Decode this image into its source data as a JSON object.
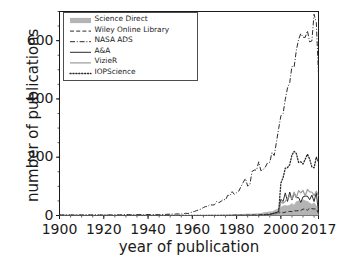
{
  "chart_data": {
    "type": "line",
    "title": "",
    "xlabel": "year of publication",
    "ylabel": "number of publications",
    "xlim": [
      1900,
      2017
    ],
    "ylim": [
      0,
      700
    ],
    "xticks": [
      1900,
      1920,
      1940,
      1960,
      1980,
      2000,
      2017
    ],
    "yticks": [
      0,
      200,
      400,
      600
    ],
    "grid": false,
    "legend_position": "upper-left",
    "x": [
      1900,
      1905,
      1910,
      1915,
      1920,
      1925,
      1930,
      1935,
      1940,
      1945,
      1950,
      1953,
      1956,
      1958,
      1960,
      1962,
      1964,
      1966,
      1968,
      1970,
      1972,
      1974,
      1976,
      1978,
      1980,
      1982,
      1984,
      1986,
      1988,
      1990,
      1991,
      1992,
      1993,
      1994,
      1995,
      1996,
      1997,
      1998,
      1999,
      2000,
      2001,
      2002,
      2003,
      2004,
      2005,
      2006,
      2007,
      2008,
      2009,
      2010,
      2011,
      2012,
      2013,
      2014,
      2015,
      2016,
      2017
    ],
    "series": [
      {
        "name": "Science Direct",
        "style": "band",
        "color": "#b4b4b4",
        "linewidth": 5,
        "values": [
          0,
          0,
          0,
          0,
          0,
          0,
          0,
          0,
          0,
          0,
          0,
          0,
          0,
          0,
          0,
          0,
          0,
          0,
          1,
          1,
          1,
          2,
          2,
          2,
          3,
          3,
          4,
          4,
          5,
          6,
          7,
          8,
          9,
          10,
          12,
          14,
          16,
          18,
          20,
          24,
          28,
          32,
          34,
          36,
          38,
          40,
          42,
          44,
          46,
          48,
          46,
          44,
          42,
          40,
          38,
          34,
          4
        ]
      },
      {
        "name": "Wiley Online Library",
        "style": "dashed",
        "color": "#2b2b2b",
        "linewidth": 1,
        "values": [
          0,
          0,
          0,
          0,
          0,
          0,
          0,
          0,
          0,
          0,
          0,
          0,
          0,
          0,
          0,
          0,
          0,
          0,
          0,
          0,
          0,
          0,
          0,
          1,
          1,
          1,
          1,
          2,
          2,
          2,
          3,
          3,
          4,
          4,
          5,
          5,
          6,
          7,
          8,
          9,
          10,
          11,
          12,
          13,
          14,
          15,
          16,
          17,
          18,
          19,
          20,
          21,
          22,
          23,
          24,
          24,
          6
        ]
      },
      {
        "name": "NASA ADS",
        "style": "dashdot",
        "color": "#2b2b2b",
        "linewidth": 1,
        "values": [
          2,
          2,
          2,
          2,
          2,
          2,
          3,
          3,
          3,
          3,
          4,
          5,
          6,
          8,
          12,
          18,
          22,
          28,
          34,
          42,
          48,
          56,
          64,
          72,
          84,
          96,
          112,
          126,
          142,
          160,
          168,
          150,
          176,
          182,
          190,
          210,
          230,
          250,
          280,
          320,
          360,
          400,
          420,
          470,
          500,
          530,
          560,
          580,
          600,
          610,
          600,
          640,
          620,
          600,
          690,
          640,
          500
        ]
      },
      {
        "name": "A&A",
        "style": "solid",
        "color": "#2b2b2b",
        "linewidth": 1,
        "values": [
          0,
          0,
          0,
          0,
          0,
          0,
          0,
          0,
          0,
          0,
          0,
          0,
          0,
          0,
          0,
          0,
          0,
          0,
          0,
          0,
          0,
          0,
          0,
          0,
          0,
          0,
          0,
          0,
          0,
          0,
          1,
          1,
          2,
          3,
          4,
          6,
          8,
          10,
          14,
          60,
          50,
          72,
          52,
          78,
          56,
          80,
          58,
          72,
          52,
          76,
          58,
          74,
          56,
          70,
          54,
          74,
          10
        ]
      },
      {
        "name": "VizieR",
        "style": "solid",
        "color": "#9a9a9a",
        "linewidth": 1.2,
        "values": [
          0,
          0,
          0,
          0,
          0,
          0,
          0,
          0,
          0,
          0,
          0,
          0,
          0,
          0,
          0,
          0,
          0,
          0,
          0,
          0,
          0,
          0,
          0,
          0,
          0,
          0,
          0,
          0,
          0,
          0,
          0,
          0,
          1,
          1,
          2,
          3,
          4,
          6,
          8,
          40,
          44,
          52,
          56,
          62,
          66,
          70,
          72,
          74,
          76,
          78,
          76,
          78,
          76,
          78,
          74,
          72,
          72
        ]
      },
      {
        "name": "IOPScience",
        "style": "dotted",
        "color": "#2b2b2b",
        "linewidth": 1.3,
        "values": [
          0,
          0,
          0,
          0,
          0,
          0,
          0,
          0,
          0,
          0,
          0,
          0,
          0,
          0,
          0,
          0,
          0,
          0,
          0,
          0,
          0,
          0,
          0,
          0,
          0,
          0,
          0,
          0,
          0,
          0,
          1,
          1,
          2,
          3,
          4,
          6,
          8,
          10,
          14,
          120,
          130,
          140,
          155,
          170,
          185,
          200,
          205,
          195,
          190,
          180,
          175,
          185,
          170,
          180,
          175,
          190,
          170
        ]
      }
    ]
  },
  "legend": {
    "items": [
      {
        "label": "Science Direct"
      },
      {
        "label": "Wiley Online Library"
      },
      {
        "label": "NASA ADS"
      },
      {
        "label": "A&A"
      },
      {
        "label": "VizieR"
      },
      {
        "label": "IOPScience"
      }
    ]
  },
  "axes": {
    "ylabel": "number of publications",
    "xlabel": "year of publication",
    "ytick_labels": [
      "0",
      "200",
      "400",
      "600"
    ],
    "xtick_labels": [
      "1900",
      "1920",
      "1940",
      "1960",
      "1980",
      "2000",
      "2017"
    ]
  }
}
